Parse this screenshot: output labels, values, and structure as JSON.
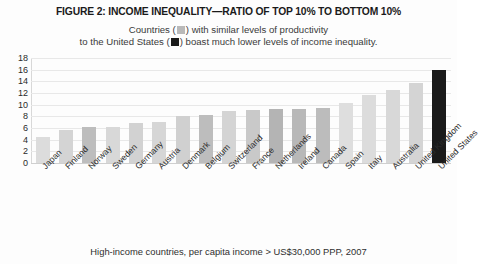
{
  "chart_data": {
    "type": "bar",
    "title": "FIGURE 2: INCOME INEQUALITY—RATIO OF TOP 10% TO BOTTOM 10%",
    "subtitle_line1_before": "Countries (",
    "subtitle_line1_after": ") with similar levels of productivity",
    "subtitle_line2_before": "to the United States (",
    "subtitle_line2_after": ") boast much lower levels of income inequality.",
    "footnote": "High-income countries, per capita income > US$30,000 PPP, 2007",
    "xlabel": "",
    "ylabel": "",
    "ylim": [
      0,
      18
    ],
    "yticks": [
      0,
      2,
      4,
      6,
      8,
      10,
      12,
      14,
      16,
      18
    ],
    "grid": true,
    "legend_position": "subtitle-inline",
    "legend": [
      {
        "label": "Countries",
        "color": "#b9b9b9"
      },
      {
        "label": "United States",
        "color": "#1a1a1a"
      }
    ],
    "categories": [
      "Japan",
      "Finland",
      "Norway",
      "Sweden",
      "Germany",
      "Austria",
      "Denmark",
      "Belgium",
      "Switzerland",
      "France",
      "Netherlands",
      "Ireland",
      "Canada",
      "Spain",
      "Italy",
      "Australia",
      "United Kingdom",
      "United States"
    ],
    "values": [
      4.5,
      5.6,
      6.1,
      6.2,
      6.9,
      7.0,
      8.1,
      8.2,
      9.0,
      9.1,
      9.2,
      9.3,
      9.4,
      10.3,
      11.6,
      12.5,
      13.8,
      15.9
    ],
    "bar_colors": [
      "#dcdcdc",
      "#d4d4d4",
      "#bdbdbd",
      "#d8d8d8",
      "#d2d2d2",
      "#d6d6d6",
      "#d0d0d0",
      "#bdbdbd",
      "#d4d4d4",
      "#c9c9c9",
      "#b4b4b4",
      "#b8b8b8",
      "#bcbcbc",
      "#dedede",
      "#dcdcdc",
      "#d8d8d8",
      "#d4d4d4",
      "#1a1a1a"
    ]
  }
}
